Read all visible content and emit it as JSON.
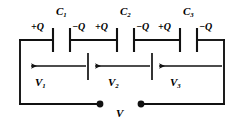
{
  "diagram": {
    "stroke_color": "#111111",
    "background_color": "#ffffff"
  },
  "capacitors": [
    {
      "label": "C",
      "sub": "1",
      "charge_left": "+Q",
      "charge_right": "−Q"
    },
    {
      "label": "C",
      "sub": "2",
      "charge_left": "+Q",
      "charge_right": "−Q"
    },
    {
      "label": "C",
      "sub": "3",
      "charge_left": "+Q",
      "charge_right": "−Q"
    }
  ],
  "voltages": [
    {
      "label": "V",
      "sub": "1"
    },
    {
      "label": "V",
      "sub": "2"
    },
    {
      "label": "V",
      "sub": "3"
    }
  ],
  "source": {
    "label": "V"
  },
  "cap_labels": {
    "c1": "C",
    "c1_sub": "1",
    "c2": "C",
    "c2_sub": "2",
    "c3": "C",
    "c3_sub": "3"
  },
  "charge_labels": {
    "c1_pos": "+Q",
    "c1_neg": "−Q",
    "c2_pos": "+Q",
    "c2_neg": "−Q",
    "c3_pos": "+Q",
    "c3_neg": "−Q"
  },
  "voltage_labels": {
    "v1": "V",
    "v1_sub": "1",
    "v2": "V",
    "v2_sub": "2",
    "v3": "V",
    "v3_sub": "3",
    "source": "V"
  }
}
